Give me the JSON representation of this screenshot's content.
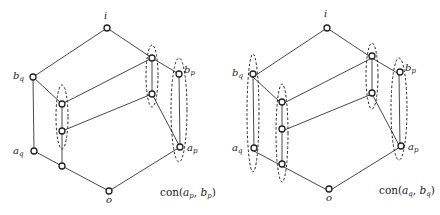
{
  "diagrams": [
    {
      "id": "left",
      "caption": {
        "text": "con(a_p, b_p)",
        "fn": "con",
        "arg1": "a",
        "arg1_sub": "p",
        "arg2": "b",
        "arg2_sub": "p"
      },
      "offset_x": 0
    },
    {
      "id": "right",
      "caption": {
        "text": "con(a_q, b_q)",
        "fn": "con",
        "arg1": "a",
        "arg1_sub": "q",
        "arg2": "b",
        "arg2_sub": "q"
      },
      "offset_x": 220
    }
  ],
  "nodes": {
    "i": {
      "label": "i",
      "x": 107,
      "y": 28
    },
    "bq": {
      "label": "b",
      "sub": "q",
      "x": 33,
      "y": 77
    },
    "R1": {
      "label": "",
      "x": 152,
      "y": 58
    },
    "bp": {
      "label": "b",
      "sub": "p",
      "x": 179,
      "y": 74
    },
    "L1": {
      "label": "",
      "x": 62,
      "y": 104
    },
    "R2": {
      "label": "",
      "x": 152,
      "y": 94
    },
    "L2": {
      "label": "",
      "x": 62,
      "y": 131
    },
    "aq": {
      "label": "a",
      "sub": "q",
      "x": 34,
      "y": 151
    },
    "ap": {
      "label": "a",
      "sub": "p",
      "x": 180,
      "y": 147
    },
    "L3": {
      "label": "",
      "x": 62,
      "y": 166
    },
    "o": {
      "label": "o",
      "x": 109,
      "y": 191
    }
  },
  "edges": [
    [
      "i",
      "bq"
    ],
    [
      "i",
      "R1"
    ],
    [
      "R1",
      "bp"
    ],
    [
      "bq",
      "L1"
    ],
    [
      "L1",
      "R1"
    ],
    [
      "R1",
      "R2"
    ],
    [
      "L1",
      "L2"
    ],
    [
      "L2",
      "R2"
    ],
    [
      "R2",
      "ap"
    ],
    [
      "bp",
      "ap"
    ],
    [
      "bq",
      "aq"
    ],
    [
      "aq",
      "L3"
    ],
    [
      "L2",
      "L3"
    ],
    [
      "L3",
      "o"
    ],
    [
      "ap",
      "o"
    ]
  ],
  "congruence_classes": {
    "left": [
      "L1-L2",
      "R1-R2",
      "bp-ap"
    ],
    "right": [
      "bq-aq",
      "L1-L3",
      "R1-R2",
      "bp-ap"
    ]
  }
}
